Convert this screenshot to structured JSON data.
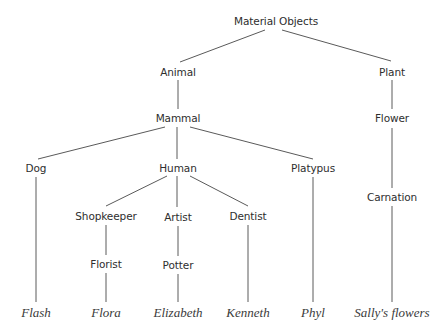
{
  "diagram": {
    "type": "taxonomy-tree",
    "nodes": [
      {
        "id": "material_objects",
        "label": "Material Objects",
        "x": 276,
        "y": 21,
        "kind": "category"
      },
      {
        "id": "animal",
        "label": "Animal",
        "x": 178,
        "y": 72,
        "kind": "category"
      },
      {
        "id": "plant",
        "label": "Plant",
        "x": 392,
        "y": 72,
        "kind": "category"
      },
      {
        "id": "mammal",
        "label": "Mammal",
        "x": 178,
        "y": 118,
        "kind": "category"
      },
      {
        "id": "flower",
        "label": "Flower",
        "x": 392,
        "y": 118,
        "kind": "category"
      },
      {
        "id": "dog",
        "label": "Dog",
        "x": 36,
        "y": 168,
        "kind": "category"
      },
      {
        "id": "human",
        "label": "Human",
        "x": 178,
        "y": 168,
        "kind": "category"
      },
      {
        "id": "platypus",
        "label": "Platypus",
        "x": 313,
        "y": 168,
        "kind": "category"
      },
      {
        "id": "carnation",
        "label": "Carnation",
        "x": 392,
        "y": 197,
        "kind": "category"
      },
      {
        "id": "shopkeeper",
        "label": "Shopkeeper",
        "x": 106,
        "y": 216,
        "kind": "category"
      },
      {
        "id": "artist",
        "label": "Artist",
        "x": 178,
        "y": 217,
        "kind": "category"
      },
      {
        "id": "dentist",
        "label": "Dentist",
        "x": 248,
        "y": 216,
        "kind": "category"
      },
      {
        "id": "florist",
        "label": "Florist",
        "x": 106,
        "y": 264,
        "kind": "category"
      },
      {
        "id": "potter",
        "label": "Potter",
        "x": 178,
        "y": 265,
        "kind": "category"
      },
      {
        "id": "flash",
        "label": "Flash",
        "x": 36,
        "y": 312,
        "kind": "individual"
      },
      {
        "id": "flora",
        "label": "Flora",
        "x": 106,
        "y": 312,
        "kind": "individual"
      },
      {
        "id": "elizabeth",
        "label": "Elizabeth",
        "x": 178,
        "y": 312,
        "kind": "individual"
      },
      {
        "id": "kenneth",
        "label": "Kenneth",
        "x": 248,
        "y": 312,
        "kind": "individual"
      },
      {
        "id": "phyl",
        "label": "Phyl",
        "x": 313,
        "y": 312,
        "kind": "individual"
      },
      {
        "id": "sallys_flowers",
        "label": "Sally's flowers",
        "x": 392,
        "y": 312,
        "kind": "individual"
      }
    ],
    "edges": [
      {
        "from": "material_objects",
        "to": "animal",
        "x1": 265,
        "y1": 30,
        "x2": 180,
        "y2": 62
      },
      {
        "from": "material_objects",
        "to": "plant",
        "x1": 282,
        "y1": 30,
        "x2": 391,
        "y2": 61
      },
      {
        "from": "animal",
        "to": "mammal",
        "x1": 178,
        "y1": 80,
        "x2": 178,
        "y2": 109
      },
      {
        "from": "plant",
        "to": "flower",
        "x1": 392,
        "y1": 80,
        "x2": 392,
        "y2": 109
      },
      {
        "from": "mammal",
        "to": "dog",
        "x1": 165,
        "y1": 127,
        "x2": 38,
        "y2": 159
      },
      {
        "from": "mammal",
        "to": "human",
        "x1": 177,
        "y1": 127,
        "x2": 177,
        "y2": 159
      },
      {
        "from": "mammal",
        "to": "platypus",
        "x1": 190,
        "y1": 127,
        "x2": 313,
        "y2": 159
      },
      {
        "from": "flower",
        "to": "carnation",
        "x1": 392,
        "y1": 128,
        "x2": 392,
        "y2": 188
      },
      {
        "from": "dog",
        "to": "flash",
        "x1": 36,
        "y1": 177,
        "x2": 36,
        "y2": 302
      },
      {
        "from": "human",
        "to": "shopkeeper",
        "x1": 167,
        "y1": 176,
        "x2": 106,
        "y2": 206
      },
      {
        "from": "human",
        "to": "artist",
        "x1": 177,
        "y1": 176,
        "x2": 177,
        "y2": 207
      },
      {
        "from": "human",
        "to": "dentist",
        "x1": 190,
        "y1": 176,
        "x2": 248,
        "y2": 206
      },
      {
        "from": "platypus",
        "to": "phyl",
        "x1": 313,
        "y1": 177,
        "x2": 313,
        "y2": 302
      },
      {
        "from": "carnation",
        "to": "sallys_flowers",
        "x1": 392,
        "y1": 206,
        "x2": 392,
        "y2": 302
      },
      {
        "from": "shopkeeper",
        "to": "florist",
        "x1": 106,
        "y1": 225,
        "x2": 106,
        "y2": 255
      },
      {
        "from": "artist",
        "to": "potter",
        "x1": 178,
        "y1": 226,
        "x2": 178,
        "y2": 256
      },
      {
        "from": "dentist",
        "to": "kenneth",
        "x1": 248,
        "y1": 225,
        "x2": 248,
        "y2": 302
      },
      {
        "from": "florist",
        "to": "flora",
        "x1": 106,
        "y1": 273,
        "x2": 106,
        "y2": 302
      },
      {
        "from": "potter",
        "to": "elizabeth",
        "x1": 178,
        "y1": 274,
        "x2": 178,
        "y2": 302
      }
    ]
  },
  "colors": {
    "line": "#5a5a5a",
    "text": "#2e2e2e",
    "leaf_text": "#3a3a3a",
    "background": "#ffffff"
  }
}
